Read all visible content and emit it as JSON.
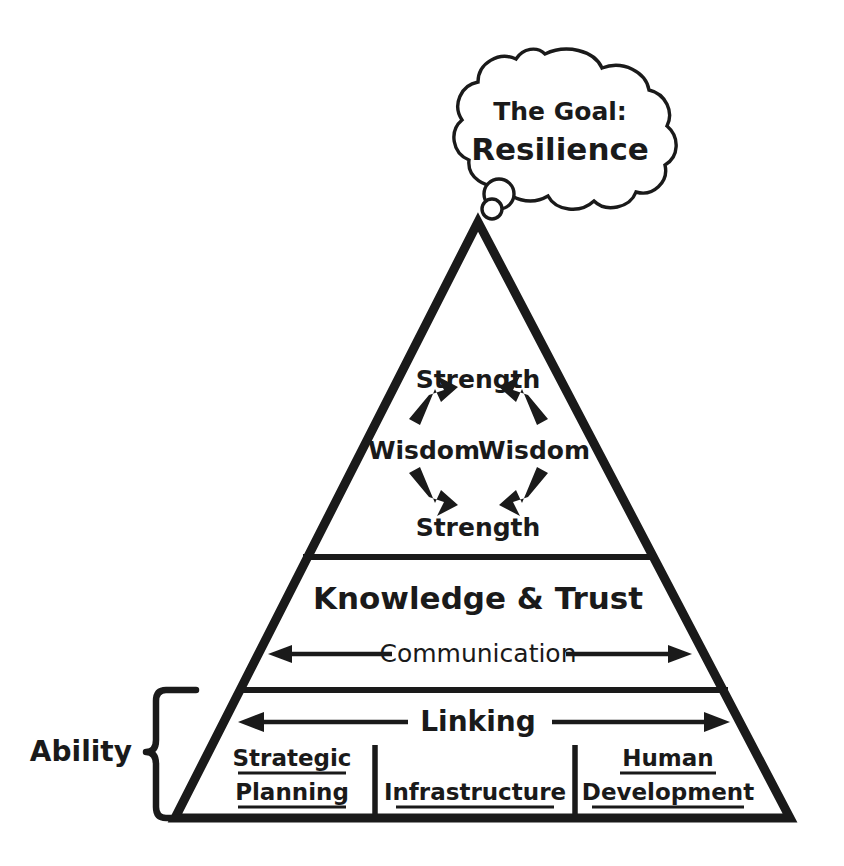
{
  "diagram": {
    "title_bubble": {
      "line1": "The Goal:",
      "line2": "Resilience"
    },
    "apex_tier": {
      "cycle": [
        {
          "id": "strength-top",
          "label": "Strength"
        },
        {
          "id": "wisdom-left",
          "label": "Wisdom"
        },
        {
          "id": "wisdom-right",
          "label": "Wisdom"
        },
        {
          "id": "strength-bottom",
          "label": "Strength"
        }
      ]
    },
    "middle_tier": {
      "title": "Knowledge & Trust",
      "flow_label": "Communication"
    },
    "base_tier": {
      "flow_label": "Linking",
      "columns": [
        {
          "id": "strategic-planning",
          "line1": "Strategic",
          "line2": "Planning"
        },
        {
          "id": "infrastructure",
          "line1": "Infrastructure",
          "line2": ""
        },
        {
          "id": "human-development",
          "line1": "Human",
          "line2": "Development"
        }
      ]
    },
    "brace": {
      "label": "Ability"
    },
    "colors": {
      "ink": "#1a1a1a",
      "background": "#ffffff"
    }
  }
}
